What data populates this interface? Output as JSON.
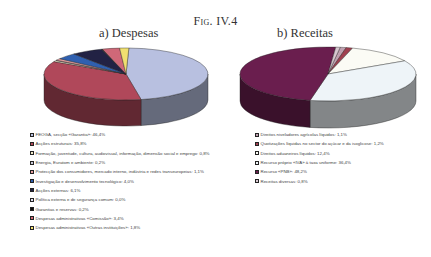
{
  "figure": {
    "title": "Fig. IV.4"
  },
  "chart_data": [
    {
      "type": "pie",
      "title": "a) Despesas",
      "categories": [
        "FEOGA, secção «Garantia»",
        "Acções estruturais",
        "Formação, juventude, cultura, audiovisual, informação, dimensão social e emprego",
        "Energia, Euratom e ambiente",
        "Protecção dos consumidores, mercado interno, indústria e redes transeuropeias",
        "Investigação e desenvolvimento tecnológico",
        "Acções externas",
        "Política externa e de segurança comum",
        "Garantias e reservas",
        "Despesas administrativas «Comissão»",
        "Despesas administrativas «Outras instituições»"
      ],
      "values": [
        46.4,
        35.8,
        0.8,
        0.2,
        1.1,
        4.0,
        6.1,
        0.0,
        0.2,
        3.4,
        1.8
      ],
      "colors": [
        "#b8c0e0",
        "#b0485a",
        "#f0e8c8",
        "#c8c8d8",
        "#e8a0a0",
        "#3060b0",
        "#222244",
        "#e0e0f0",
        "#101010",
        "#d06878",
        "#f0e070"
      ],
      "legend_position": "bottom-left",
      "style": "3d"
    },
    {
      "type": "pie",
      "title": "b) Receitas",
      "categories": [
        "Direitos niveladores agrícolas líquidos",
        "Quotizações líquidas no sector do açúcar e da isoglicose",
        "Direitos aduaneiros líquidos",
        "Recurso próprio «IVA» à taxa uniforme",
        "Recurso «PNB»",
        "Receitas diversas"
      ],
      "values": [
        1.1,
        1.2,
        12.4,
        36.4,
        48.2,
        0.8
      ],
      "colors": [
        "#c0a0b0",
        "#a04050",
        "#fbfbf5",
        "#eef4f8",
        "#6a1e4e",
        "#d8c8d0"
      ],
      "legend_position": "bottom-left",
      "style": "3d"
    }
  ],
  "legend_a": [
    {
      "label": "FEOGA, secção «Garantia»: 46,4%",
      "color": "#b8c0e0"
    },
    {
      "label": "Acções estruturais: 35,8%",
      "color": "#b0485a"
    },
    {
      "label": "Formação, juventude, cultura, audiovisual, informação, dimensão social e emprego: 0,8%",
      "color": "#f0e8c8"
    },
    {
      "label": "Energia, Euratom e ambiente: 0,2%",
      "color": "#c8c8d8"
    },
    {
      "label": "Protecção dos consumidores, mercado interno, indústria e redes transeuropeias: 1,1%",
      "color": "#e8a0a0"
    },
    {
      "label": "Investigação e desenvolvimento tecnológico: 4,0%",
      "color": "#3060b0"
    },
    {
      "label": "Acções externas: 6,1%",
      "color": "#222244"
    },
    {
      "label": "Política externa e de segurança comum: 0,0%",
      "color": "#e0e0f0"
    },
    {
      "label": "Garantias e reservas: 0,2%",
      "color": "#101010"
    },
    {
      "label": "Despesas administrativas «Comissão»: 3,4%",
      "color": "#d06878"
    },
    {
      "label": "Despesas administrativas «Outras instituições»: 1,8%",
      "color": "#f0e070"
    }
  ],
  "legend_b": [
    {
      "label": "Direitos niveladores agrícolas líquidos: 1,1%",
      "color": "#c0a0b0"
    },
    {
      "label": "Quotizações líquidas no sector do açúcar e da isoglicose: 1,2%",
      "color": "#a04050"
    },
    {
      "label": "Direitos aduaneiros líquidos: 12,4%",
      "color": "#fbfbf5"
    },
    {
      "label": "Recurso próprio «IVA» à taxa uniforme: 36,4%",
      "color": "#eef4f8"
    },
    {
      "label": "Recurso «PNB»: 48,2%",
      "color": "#6a1e4e"
    },
    {
      "label": "Receitas diversas: 0,8%",
      "color": "#d8c8d0"
    }
  ]
}
